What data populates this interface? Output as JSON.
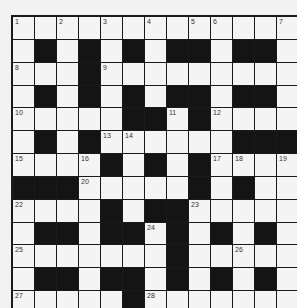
{
  "puzzle": {
    "rows": 13,
    "cols": 13,
    "grid": [
      ".............",
      ".#.#.#.##.##.",
      "...#.........",
      ".#.#.#.##.##.",
      ".....##.#....",
      ".#.#......###",
      "....#.#.#....",
      "###.....#.#.",
      "....#.##.....",
      ".##.##.#.#.#.",
      ".......#.....",
      ".##.##.#.#.#.",
      ".....#......."
    ],
    "numbers": [
      {
        "r": 0,
        "c": 0,
        "n": "1"
      },
      {
        "r": 0,
        "c": 2,
        "n": "2"
      },
      {
        "r": 0,
        "c": 4,
        "n": "3"
      },
      {
        "r": 0,
        "c": 6,
        "n": "4"
      },
      {
        "r": 0,
        "c": 8,
        "n": "5"
      },
      {
        "r": 0,
        "c": 9,
        "n": "6"
      },
      {
        "r": 0,
        "c": 12,
        "n": "7"
      },
      {
        "r": 2,
        "c": 0,
        "n": "8"
      },
      {
        "r": 2,
        "c": 4,
        "n": "9"
      },
      {
        "r": 4,
        "c": 0,
        "n": "10"
      },
      {
        "r": 4,
        "c": 7,
        "n": "11"
      },
      {
        "r": 4,
        "c": 9,
        "n": "12"
      },
      {
        "r": 5,
        "c": 4,
        "n": "13"
      },
      {
        "r": 5,
        "c": 5,
        "n": "14"
      },
      {
        "r": 6,
        "c": 0,
        "n": "15"
      },
      {
        "r": 6,
        "c": 3,
        "n": "16"
      },
      {
        "r": 6,
        "c": 9,
        "n": "17"
      },
      {
        "r": 6,
        "c": 10,
        "n": "18"
      },
      {
        "r": 6,
        "c": 12,
        "n": "19"
      },
      {
        "r": 7,
        "c": 3,
        "n": "20"
      },
      {
        "r": 7,
        "c": 8,
        "n": "21"
      },
      {
        "r": 8,
        "c": 0,
        "n": "22"
      },
      {
        "r": 8,
        "c": 8,
        "n": "23"
      },
      {
        "r": 9,
        "c": 6,
        "n": "24"
      },
      {
        "r": 10,
        "c": 0,
        "n": "25"
      },
      {
        "r": 10,
        "c": 10,
        "n": "26"
      },
      {
        "r": 12,
        "c": 0,
        "n": "27"
      },
      {
        "r": 12,
        "c": 6,
        "n": "28"
      }
    ]
  }
}
